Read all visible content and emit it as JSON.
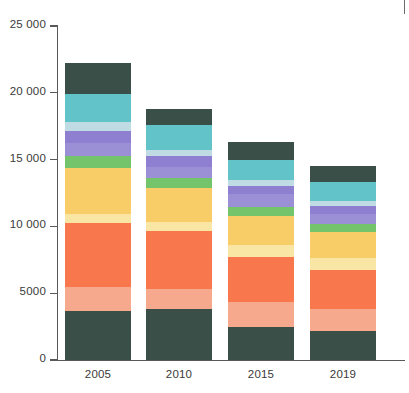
{
  "chart_data": {
    "type": "bar",
    "stacked": true,
    "title": "",
    "subtitle": "",
    "xlabel": "",
    "ylabel": "",
    "categories": [
      "2005",
      "2010",
      "2015",
      "2019"
    ],
    "ylim": [
      0,
      25000
    ],
    "ytick_values": [
      0,
      5000,
      10000,
      15000,
      20000,
      25000
    ],
    "ytick_labels": [
      "0",
      "5000",
      "10 000",
      "15 000",
      "20 000",
      "25 000"
    ],
    "grid": false,
    "legend": "none",
    "totals": [
      22200,
      18800,
      16300,
      14500
    ],
    "series": [
      {
        "name": "series-1",
        "color": "#3a4f47",
        "values": [
          3650,
          3800,
          2500,
          2200
        ]
      },
      {
        "name": "series-2",
        "color": "#f7a98e",
        "values": [
          1800,
          1500,
          1850,
          1600
        ]
      },
      {
        "name": "series-3",
        "color": "#f8774c",
        "values": [
          4800,
          4350,
          3350,
          2950
        ]
      },
      {
        "name": "series-4",
        "color": "#fae6a4",
        "values": [
          700,
          700,
          900,
          900
        ]
      },
      {
        "name": "series-5",
        "color": "#f8cc66",
        "values": [
          3400,
          2500,
          2200,
          1900
        ]
      },
      {
        "name": "series-6",
        "color": "#74c46b",
        "values": [
          900,
          750,
          650,
          600
        ]
      },
      {
        "name": "series-7",
        "color": "#9b8fd6",
        "values": [
          1000,
          850,
          950,
          750
        ]
      },
      {
        "name": "series-8",
        "color": "#8f7fd1",
        "values": [
          900,
          800,
          600,
          600
        ]
      },
      {
        "name": "series-9",
        "color": "#bfdce5",
        "values": [
          650,
          500,
          450,
          400
        ]
      },
      {
        "name": "series-10",
        "color": "#62c3c8",
        "values": [
          2150,
          1850,
          1500,
          1450
        ]
      },
      {
        "name": "series-11",
        "color": "#3a4f47",
        "values": [
          2250,
          1200,
          1350,
          1150
        ]
      }
    ]
  },
  "axis": {
    "y_tick_0": "0",
    "y_tick_1": "5000",
    "y_tick_2": "10 000",
    "y_tick_3": "15 000",
    "y_tick_4": "20 000",
    "y_tick_5": "25 000",
    "x_tick_0": "2005",
    "x_tick_1": "2010",
    "x_tick_2": "2015",
    "x_tick_3": "2019"
  }
}
